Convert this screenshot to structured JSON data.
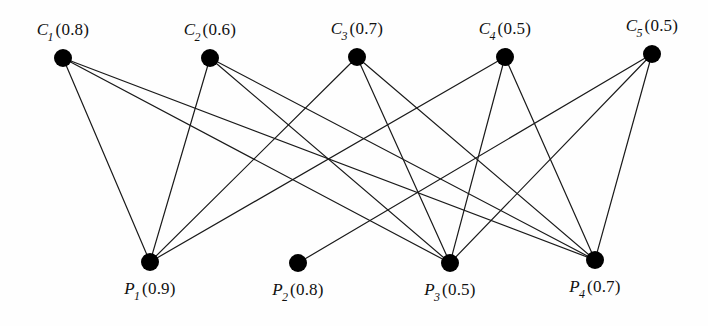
{
  "figure": {
    "type": "bipartite-graph",
    "background_color": "#fefefe",
    "node_color": "#000000",
    "edge_color": "#1a1a1a",
    "node_radius": 9,
    "edge_width": 1.2
  },
  "chart_data": {
    "type": "diagram",
    "title": "",
    "top_nodes": [
      {
        "id": "C1",
        "name": "C",
        "subscript": "1",
        "value": "0.8",
        "label": "C1(0.8)",
        "x": 63,
        "y": 58
      },
      {
        "id": "C2",
        "name": "C",
        "subscript": "2",
        "value": "0.6",
        "label": "C2(0.6)",
        "x": 210,
        "y": 58
      },
      {
        "id": "C3",
        "name": "C",
        "subscript": "3",
        "value": "0.7",
        "label": "C3(0.7)",
        "x": 357,
        "y": 57
      },
      {
        "id": "C4",
        "name": "C",
        "subscript": "4",
        "value": "0.5",
        "label": "C4(0.5)",
        "x": 505,
        "y": 57
      },
      {
        "id": "C5",
        "name": "C",
        "subscript": "5",
        "value": "0.5",
        "label": "C5(0.5)",
        "x": 652,
        "y": 54
      }
    ],
    "bottom_nodes": [
      {
        "id": "P1",
        "name": "P",
        "subscript": "1",
        "value": "0.9",
        "label": "P1(0.9)",
        "x": 150,
        "y": 262
      },
      {
        "id": "P2",
        "name": "P",
        "subscript": "2",
        "value": "0.8",
        "label": "P2(0.8)",
        "x": 298,
        "y": 263
      },
      {
        "id": "P3",
        "name": "P",
        "subscript": "3",
        "value": "0.5",
        "label": "P3(0.5)",
        "x": 450,
        "y": 263
      },
      {
        "id": "P4",
        "name": "P",
        "subscript": "4",
        "value": "0.7",
        "label": "P4(0.7)",
        "x": 595,
        "y": 260
      }
    ],
    "edges": [
      {
        "from": "C1",
        "to": "P1"
      },
      {
        "from": "C1",
        "to": "P3"
      },
      {
        "from": "C1",
        "to": "P4"
      },
      {
        "from": "C2",
        "to": "P1"
      },
      {
        "from": "C2",
        "to": "P3"
      },
      {
        "from": "C2",
        "to": "P4"
      },
      {
        "from": "C3",
        "to": "P1"
      },
      {
        "from": "C3",
        "to": "P3"
      },
      {
        "from": "C3",
        "to": "P4"
      },
      {
        "from": "C4",
        "to": "P1"
      },
      {
        "from": "C4",
        "to": "P3"
      },
      {
        "from": "C4",
        "to": "P4"
      },
      {
        "from": "C5",
        "to": "P2"
      },
      {
        "from": "C5",
        "to": "P3"
      },
      {
        "from": "C5",
        "to": "P4"
      }
    ]
  }
}
